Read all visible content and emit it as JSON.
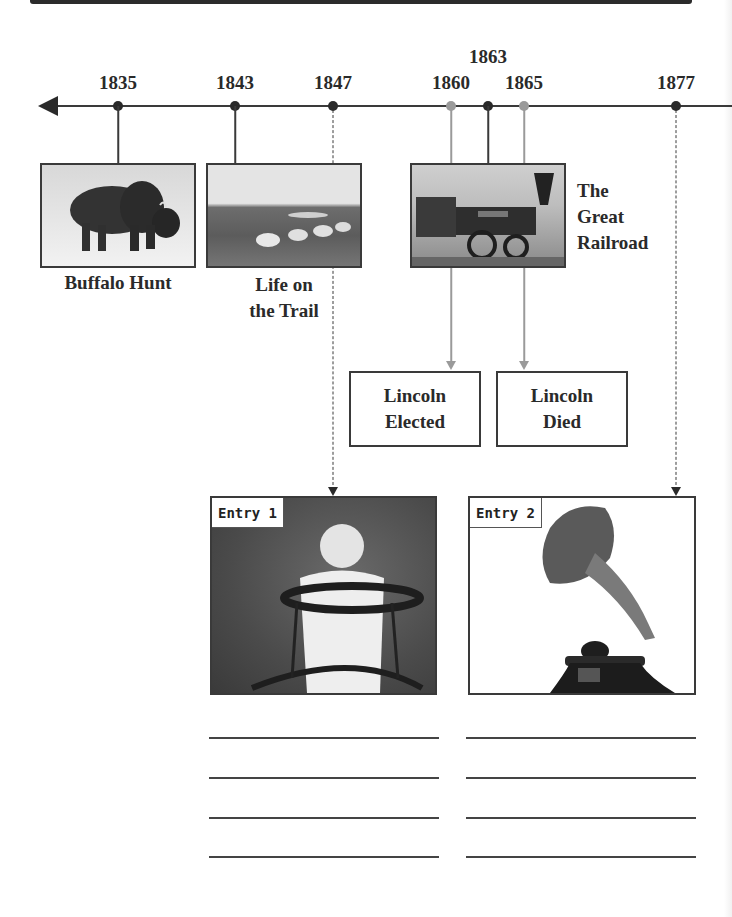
{
  "timeline": {
    "years": [
      {
        "label": "1835",
        "x": 118,
        "color": "black"
      },
      {
        "label": "1843",
        "x": 235,
        "color": "black"
      },
      {
        "label": "1847",
        "x": 333,
        "color": "black"
      },
      {
        "label": "1860",
        "x": 451,
        "color": "gray"
      },
      {
        "label": "1863",
        "x": 488,
        "color": "black"
      },
      {
        "label": "1865",
        "x": 524,
        "color": "gray"
      },
      {
        "label": "1877",
        "x": 676,
        "color": "black"
      }
    ]
  },
  "photos": {
    "buffalo": {
      "caption": "Buffalo Hunt"
    },
    "trail": {
      "caption_line1": "Life on",
      "caption_line2": "the Trail"
    },
    "railroad": {
      "caption_line1": "The",
      "caption_line2": "Great",
      "caption_line3": "Railroad"
    }
  },
  "events": {
    "lincoln_elected": {
      "line1": "Lincoln",
      "line2": "Elected"
    },
    "lincoln_died": {
      "line1": "Lincoln",
      "line2": "Died"
    }
  },
  "entries": [
    {
      "label": "Entry 1",
      "image": "baby-in-walker-photo",
      "writing_lines": 4
    },
    {
      "label": "Entry 2",
      "image": "phonograph-photo",
      "writing_lines": 4
    }
  ]
}
